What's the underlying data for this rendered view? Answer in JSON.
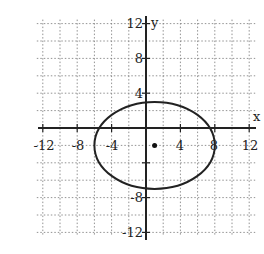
{
  "chart_data": {
    "type": "line",
    "title": "",
    "xlabel": "x",
    "ylabel": "y",
    "xlim": [
      -12,
      12
    ],
    "ylim": [
      -12,
      12
    ],
    "grid": true,
    "grid_step": 2,
    "x_ticks": [
      "-12",
      "-8",
      "-4",
      "4",
      "8",
      "12"
    ],
    "y_ticks": [
      "12",
      "8",
      "4",
      "-8",
      "-12"
    ],
    "series": [
      {
        "name": "ellipse",
        "shape": "ellipse",
        "center": [
          1,
          -2
        ],
        "semi_major_x": 7,
        "semi_minor_y": 5,
        "extremes": {
          "left": [
            -6,
            -2
          ],
          "right": [
            8,
            -2
          ],
          "top": [
            1,
            3
          ],
          "bottom": [
            1,
            -7
          ]
        }
      }
    ],
    "points": [
      {
        "label": "center",
        "x": 1,
        "y": -2
      }
    ]
  },
  "labels": {
    "x_axis": "x",
    "y_axis": "y",
    "xt": [
      "-12",
      "-8",
      "-4",
      "4",
      "8",
      "12"
    ],
    "yt": [
      "12",
      "8",
      "4",
      "-8",
      "-12"
    ]
  }
}
